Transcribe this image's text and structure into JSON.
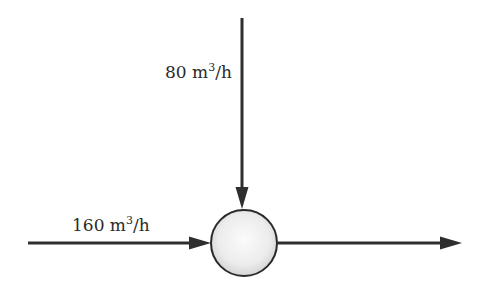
{
  "diagram": {
    "type": "flow-junction",
    "inputs": [
      {
        "id": "top-inflow",
        "direction": "from-top",
        "value": "80",
        "unit_base": "m",
        "unit_exp": "3",
        "unit_tail": "/h"
      },
      {
        "id": "left-inflow",
        "direction": "from-left",
        "value": "160",
        "unit_base": "m",
        "unit_exp": "3",
        "unit_tail": "/h"
      }
    ],
    "output": {
      "id": "right-outflow",
      "direction": "to-right",
      "label": ""
    },
    "node": {
      "shape": "circle",
      "fill_center": "#fafafa",
      "fill_edge": "#d6d6d6",
      "stroke": "#2a2a2a"
    },
    "colors": {
      "line": "#2e2e2e",
      "text": "#2a2a2a",
      "background": "#ffffff"
    }
  }
}
